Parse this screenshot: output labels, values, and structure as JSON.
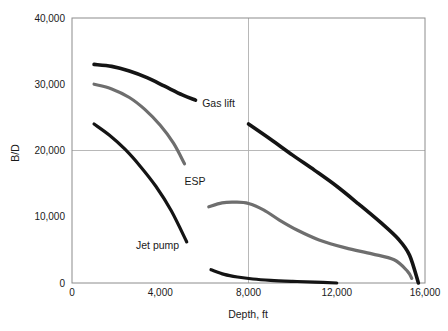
{
  "chart_data": {
    "type": "line",
    "title": "",
    "xlabel": "Depth, ft",
    "ylabel": "B/D",
    "xlim": [
      0,
      16000
    ],
    "ylim": [
      0,
      40000
    ],
    "xticks": [
      0,
      4000,
      8000,
      12000,
      16000
    ],
    "xtick_labels": [
      "0",
      "4,000",
      "8,000",
      "12,000",
      "16,000"
    ],
    "yticks": [
      0,
      10000,
      20000,
      30000,
      40000
    ],
    "ytick_labels": [
      "0",
      "10,000",
      "20,000",
      "30,000",
      "40,000"
    ],
    "grid": "major gridlines at x=8,000 and y=20,000 only",
    "legend_position": "inline annotations next to curves",
    "series": [
      {
        "name": "Gas lift",
        "color": "#141414",
        "width": 3.6,
        "label_x": 5900,
        "label_y": 26600,
        "segments": [
          {
            "x": [
              1000,
              1800,
              2600,
              3400,
              4200,
              5000,
              5600
            ],
            "y": [
              33000,
              32700,
              32000,
              31000,
              29700,
              28400,
              27600
            ]
          },
          {
            "x": [
              8000,
              9000,
              10000,
              11000,
              12000,
              13000,
              14000,
              14800,
              15300,
              15700
            ],
            "y": [
              24000,
              21700,
              19300,
              17000,
              14600,
              11900,
              9100,
              6600,
              4200,
              0
            ]
          }
        ]
      },
      {
        "name": "ESP",
        "color": "#6e6e6e",
        "width": 3.2,
        "label_x": 5100,
        "label_y": 14800,
        "segments": [
          {
            "x": [
              1000,
              1800,
              2600,
              3300,
              4000,
              4600,
              5100
            ],
            "y": [
              30000,
              29300,
              28000,
              26200,
              23800,
              21100,
              18000
            ]
          },
          {
            "x": [
              6200,
              6800,
              7400,
              8000,
              8700,
              9400,
              10200,
              11200,
              12400,
              13600,
              14600,
              15200,
              15400
            ],
            "y": [
              11500,
              12100,
              12200,
              12000,
              11000,
              9500,
              8000,
              6500,
              5300,
              4400,
              3500,
              1800,
              700
            ]
          }
        ]
      },
      {
        "name": "Jet pump",
        "color": "#141414",
        "width": 3.2,
        "label_x": 2900,
        "label_y": 5200,
        "segments": [
          {
            "x": [
              1000,
              1700,
              2400,
              3100,
              3800,
              4500,
              5200
            ],
            "y": [
              24000,
              22300,
              20200,
              17600,
              14600,
              10900,
              6200
            ]
          },
          {
            "x": [
              6300,
              6900,
              7500,
              8200,
              9000,
              10000,
              11000,
              12000
            ],
            "y": [
              2000,
              1300,
              900,
              600,
              400,
              250,
              130,
              0
            ]
          }
        ]
      }
    ]
  },
  "axes": {
    "x_title": "Depth, ft",
    "y_title": "B/D"
  }
}
